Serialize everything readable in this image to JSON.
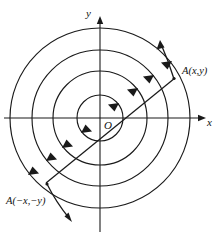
{
  "figure": {
    "type": "polar-concentric-circles-diagram",
    "background_color": "#ffffff",
    "ink_color": "#1a1a1a",
    "width": 222,
    "height": 235,
    "origin": {
      "x": 100,
      "y": 118
    },
    "axes": {
      "x_label": "x",
      "y_label": "y",
      "x_start": {
        "x": 4,
        "y": 118
      },
      "x_end": {
        "x": 206,
        "y": 118
      },
      "y_start": {
        "x": 100,
        "y": 232
      },
      "y_end": {
        "x": 100,
        "y": 16
      },
      "arrowheads": [
        "x-positive",
        "y-positive"
      ]
    },
    "origin_label": "O",
    "circles": [
      {
        "index": 1,
        "radius": 23
      },
      {
        "index": 2,
        "radius": 47
      },
      {
        "index": 3,
        "radius": 68
      },
      {
        "index": 4,
        "radius": 90
      }
    ],
    "diagonal_line": {
      "angle_degrees": 39,
      "point_upper_right": {
        "x": 173,
        "y": 78
      },
      "point_lower_left": {
        "x": 27,
        "y": 158
      }
    },
    "points": [
      {
        "name": "A-upper-right",
        "label": "A(x,y)",
        "x": 173,
        "y": 78
      },
      {
        "name": "A-lower-left",
        "label": "A(−x,−y)",
        "x": 48,
        "y": 185
      }
    ],
    "direction_arrows": {
      "description": "tangential arrowheads on each circle indicating rotational sense",
      "count_upper_right": 4,
      "count_lower_left": 4
    },
    "outer_tangent_arrows": [
      {
        "name": "outer-tangent-arrow-upper",
        "from": {
          "x": 173,
          "y": 78
        },
        "to": {
          "x": 160,
          "y": 41
        }
      },
      {
        "name": "outer-tangent-arrow-lower",
        "from": {
          "x": 48,
          "y": 185
        },
        "to": {
          "x": 72,
          "y": 222
        }
      }
    ]
  }
}
